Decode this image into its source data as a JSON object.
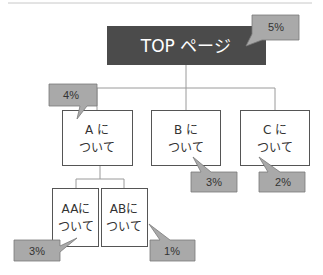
{
  "diagram": {
    "top_node": {
      "label": "TOP ページ",
      "rate": "5%"
    },
    "children": [
      {
        "id": "a",
        "line1": "A に",
        "line2": "ついて",
        "rate": "4%"
      },
      {
        "id": "b",
        "line1": "B に",
        "line2": "ついて",
        "rate": "3%"
      },
      {
        "id": "c",
        "line1": "C に",
        "line2": "ついて",
        "rate": "2%"
      }
    ],
    "grandchildren": [
      {
        "id": "aa",
        "line1": "AAに",
        "line2": "ついて",
        "rate": "3%"
      },
      {
        "id": "ab",
        "line1": "ABに",
        "line2": "ついて",
        "rate": "1%"
      }
    ],
    "colors": {
      "top_fill": "#4b4b4b",
      "callout_fill": "#a9a9a9",
      "callout_border": "#7a7a7a",
      "node_border": "#555555",
      "connector": "#9a9a9a"
    }
  }
}
